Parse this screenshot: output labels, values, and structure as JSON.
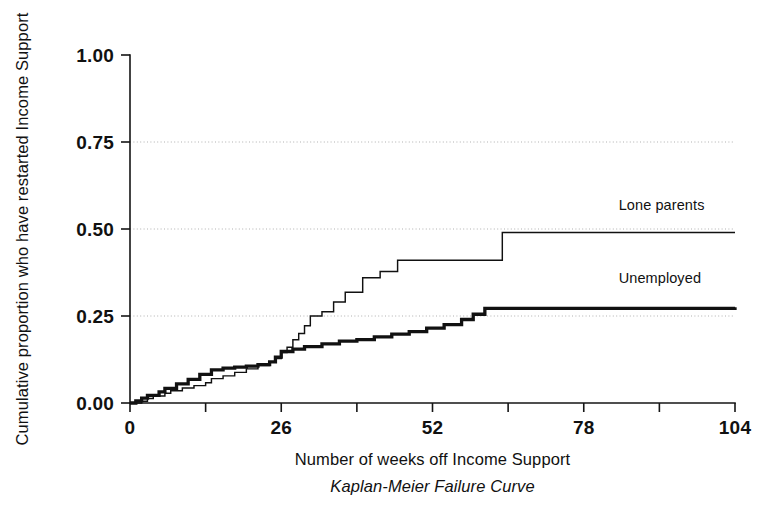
{
  "chart_data": {
    "type": "line",
    "title": "",
    "caption": "Kaplan-Meier Failure Curve",
    "xlabel": "Number of weeks off Income Support",
    "ylabel": "Cumulative proportion who have restarted Income Support",
    "xlim": [
      0,
      104
    ],
    "ylim": [
      0,
      1.0
    ],
    "xticks": [
      0,
      26,
      52,
      78,
      104
    ],
    "xticklabels": [
      "0",
      "26",
      "52",
      "78",
      "104"
    ],
    "yticks": [
      0.0,
      0.25,
      0.5,
      0.75,
      1.0
    ],
    "yticklabels": [
      "0.00",
      "0.25",
      "0.50",
      "0.75",
      "1.00"
    ],
    "grid": "horizontal-dotted-at-0.25-0.50-0.75",
    "legend_position": "inline-right-labels",
    "step_style": "post",
    "series": [
      {
        "name": "Lone parents",
        "style": "thin",
        "label_x": 84,
        "label_y": 0.555,
        "x": [
          0,
          2,
          3,
          4,
          6,
          7,
          9,
          11,
          13,
          14,
          16,
          18,
          20,
          22,
          24,
          25,
          26,
          27,
          28,
          29,
          30,
          31,
          33,
          35,
          37,
          40,
          43,
          46,
          64,
          104
        ],
        "y": [
          0.0,
          0.005,
          0.013,
          0.02,
          0.028,
          0.035,
          0.043,
          0.05,
          0.058,
          0.07,
          0.078,
          0.088,
          0.098,
          0.108,
          0.118,
          0.128,
          0.145,
          0.16,
          0.182,
          0.2,
          0.222,
          0.25,
          0.262,
          0.29,
          0.318,
          0.36,
          0.378,
          0.41,
          0.49,
          0.49
        ]
      },
      {
        "name": "Unemployed",
        "style": "thick",
        "label_x": 84,
        "label_y": 0.345,
        "x": [
          0,
          1,
          2,
          3,
          5,
          6,
          8,
          10,
          12,
          14,
          16,
          18,
          20,
          22,
          24,
          25,
          26,
          28,
          30,
          33,
          36,
          39,
          42,
          45,
          48,
          51,
          54,
          57,
          59,
          61,
          104
        ],
        "y": [
          0.0,
          0.006,
          0.014,
          0.022,
          0.032,
          0.042,
          0.055,
          0.068,
          0.082,
          0.095,
          0.1,
          0.103,
          0.106,
          0.11,
          0.118,
          0.132,
          0.148,
          0.155,
          0.162,
          0.17,
          0.178,
          0.182,
          0.19,
          0.198,
          0.205,
          0.215,
          0.225,
          0.24,
          0.255,
          0.272,
          0.275
        ]
      }
    ]
  },
  "plot": {
    "left": 130,
    "right": 735,
    "top": 55,
    "bottom": 403
  }
}
